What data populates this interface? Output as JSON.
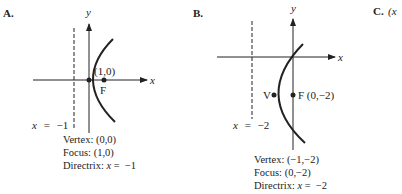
{
  "panels": [
    {
      "label": "A.",
      "x_axis_label": "x",
      "y_axis_label": "y",
      "vertex_point_label": "(1,0)",
      "focus_point_label": "F",
      "directrix_label_var": "x",
      "directrix_label_eq": "=",
      "directrix_label_val": "−1",
      "vertex": [
        0,
        0
      ],
      "focus": [
        1,
        0
      ],
      "directrix_x": -1,
      "info": {
        "vertex_text": "Vertex: (0,0)",
        "focus_text": "Focus: (1,0)",
        "directrix_prefix": "Directrix: ",
        "directrix_var": "x",
        "directrix_rest": " =  −1"
      }
    },
    {
      "label": "B.",
      "x_axis_label": "x",
      "y_axis_label": "y",
      "vertex_point_label": "V",
      "focus_point_label": "F (0,−2)",
      "directrix_label_var": "x",
      "directrix_label_eq": "=",
      "directrix_label_val": "−2",
      "vertex": [
        -1,
        -2
      ],
      "focus": [
        0,
        -2
      ],
      "directrix_x": -2,
      "info": {
        "vertex_text": "Vertex: (−1,−2)",
        "focus_text": "Focus: (0,−2)",
        "directrix_prefix": "Directrix: ",
        "directrix_var": "x",
        "directrix_rest": " =  −2"
      }
    }
  ],
  "panel_c": {
    "label": "C.",
    "partial_text": "(x"
  }
}
